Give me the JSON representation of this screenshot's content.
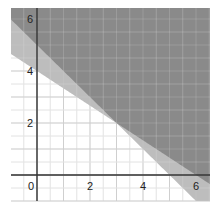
{
  "chart_data": {
    "type": "inequality-region",
    "title": "",
    "xlabel": "",
    "ylabel": "",
    "xlim": [
      -1,
      6.5
    ],
    "ylim": [
      -1,
      6.5
    ],
    "grid": true,
    "x_ticks": [
      0,
      2,
      4,
      6
    ],
    "y_ticks": [
      2,
      4,
      6
    ],
    "x_tick_labels": [
      "0",
      "2",
      "4",
      "6"
    ],
    "y_tick_labels": [
      "2",
      "4",
      "6"
    ],
    "lines": [
      {
        "name": "line-a",
        "equation": "y = 5 - x",
        "slope": -1,
        "intercept": 5
      },
      {
        "name": "line-b",
        "equation": "y = 4 - (2/3)x",
        "slope": -0.6667,
        "intercept": 4
      }
    ],
    "intersection": [
      3,
      2
    ],
    "regions": [
      {
        "name": "both-satisfied",
        "description": "y >= 5 - x and y >= 4 - 2x/3",
        "color": "#8a8a8a"
      },
      {
        "name": "one-satisfied",
        "description": "above exactly one line",
        "color": "#bdbdbd"
      },
      {
        "name": "none",
        "description": "below both lines",
        "color": "#ffffff"
      }
    ]
  },
  "colors": {
    "dark": "#8a8a8a",
    "light": "#bdbdbd",
    "grid_minor": "#e6e6e6",
    "grid_major": "#cfcfcf",
    "axis": "#333333"
  }
}
